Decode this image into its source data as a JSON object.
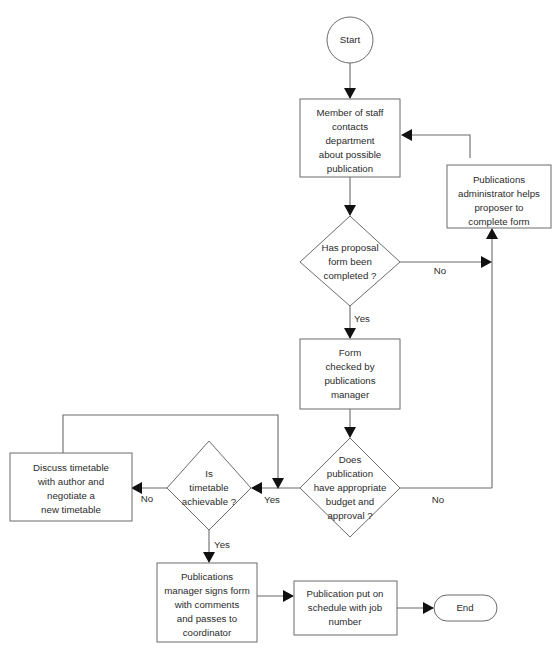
{
  "diagram": {
    "background_color": "#ffffff",
    "line_color": "#6b6b6b",
    "text_color": "#2b2b2b",
    "arrow_color": "#111111"
  },
  "nodes": {
    "start": {
      "type": "terminator",
      "label": "Start"
    },
    "contact": {
      "type": "process",
      "lines": [
        "Member of staff",
        "contacts",
        "department",
        "about possible",
        "publication"
      ]
    },
    "admin_helps": {
      "type": "process",
      "lines": [
        "Publications",
        "administrator helps",
        "proposer to",
        "complete form"
      ]
    },
    "form_completed": {
      "type": "decision",
      "lines": [
        "Has proposal",
        "form been",
        "completed ?"
      ]
    },
    "form_checked": {
      "type": "process",
      "lines": [
        "Form",
        "checked by",
        "publications",
        "manager"
      ]
    },
    "budget_approval": {
      "type": "decision",
      "lines": [
        "Does",
        "publication",
        "have appropriate",
        "budget and",
        "approval ?"
      ]
    },
    "timetable_achievable": {
      "type": "decision",
      "lines": [
        "Is",
        "timetable",
        "achievable ?"
      ]
    },
    "discuss_timetable": {
      "type": "process",
      "lines": [
        "Discuss timetable",
        "with author and",
        "negotiate a",
        "new timetable"
      ]
    },
    "manager_signs": {
      "type": "process",
      "lines": [
        "Publications",
        "manager signs form",
        "with comments",
        "and passes to",
        "coordinator"
      ]
    },
    "schedule_job": {
      "type": "process",
      "lines": [
        "Publication put on",
        "schedule with job",
        "number"
      ]
    },
    "end": {
      "type": "terminator",
      "label": "End"
    }
  },
  "edge_labels": {
    "form_completed_no": "No",
    "form_completed_yes": "Yes",
    "budget_no": "No",
    "budget_yes": "Yes",
    "timetable_no": "No",
    "timetable_yes": "Yes"
  }
}
